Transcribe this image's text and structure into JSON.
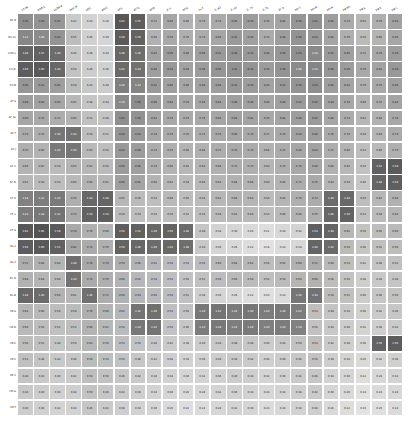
{
  "figure": {
    "type": "heatmap",
    "background": "#ffffff",
    "annotated": true,
    "colormap": "greys",
    "colormap_low": "#f2f2f2",
    "colormap_high": "#333333",
    "text_color_light": "#ffffff",
    "text_color_dark": "#262626"
  },
  "chart_data": {
    "type": "heatmap",
    "title": "",
    "xlabel": "",
    "ylabel": "",
    "grid": false,
    "legend": "none",
    "colorbar": false,
    "annotations": true,
    "colormap": "Greys",
    "vmin": 0.0,
    "vmax": 2.0,
    "x_tick_rotation": -30,
    "columns": [
      "FT-PB",
      "RQN-L",
      "LSTM-B",
      "PHP-JR",
      "SDJC",
      "BSVC",
      "AFS",
      "AFCL",
      "AFM",
      "JF-X",
      "AFLL",
      "FS-T",
      "IC-B2",
      "IC-SV",
      "IC-7S",
      "IC-TL",
      "ID-Q",
      "HD-1",
      "HD-M",
      "HD-N",
      "HB-NS",
      "HB-L",
      "HB-K",
      "HB-C"
    ],
    "rows": [
      "DF-B",
      "BH-VL",
      "CVD-L",
      "CV-JE",
      "CV-M",
      "AF-S",
      "AF-SL",
      "AF-T",
      "AF-J",
      "AF-C",
      "AF-N",
      "HF-K",
      "HF-L",
      "HF-S",
      "BL-1",
      "BL-2",
      "BL-Q",
      "BL-N",
      "HB-S",
      "HB-R",
      "HB-E",
      "HB-V",
      "HB-2",
      "HB-G",
      "HB-T"
    ],
    "values": [
      [
        1.05,
        1.0,
        0.95,
        0.42,
        0.33,
        0.28,
        1.62,
        1.55,
        0.72,
        0.8,
        0.66,
        0.7,
        0.74,
        0.86,
        0.9,
        0.78,
        0.82,
        0.96,
        1.02,
        0.88,
        0.74,
        0.62,
        0.7,
        0.84
      ],
      [
        1.12,
        1.08,
        0.98,
        0.55,
        0.36,
        0.3,
        1.58,
        1.5,
        0.68,
        0.76,
        0.7,
        0.74,
        0.8,
        0.92,
        0.86,
        0.74,
        0.88,
        1.0,
        0.94,
        0.82,
        0.7,
        0.58,
        0.66,
        0.8
      ],
      [
        1.48,
        1.52,
        1.4,
        0.46,
        0.38,
        0.34,
        1.46,
        1.38,
        0.84,
        0.9,
        0.8,
        0.86,
        0.92,
        0.98,
        0.94,
        0.88,
        0.96,
        1.04,
        1.1,
        0.92,
        0.86,
        0.72,
        0.78,
        0.9
      ],
      [
        1.56,
        1.6,
        1.44,
        0.5,
        0.4,
        0.36,
        1.42,
        1.34,
        0.88,
        0.94,
        0.84,
        0.9,
        0.96,
        1.02,
        0.98,
        0.9,
        1.0,
        1.08,
        1.14,
        0.96,
        0.9,
        0.76,
        0.82,
        0.94
      ],
      [
        0.96,
        0.92,
        0.88,
        0.58,
        0.44,
        0.4,
        1.2,
        1.14,
        0.92,
        0.86,
        0.8,
        0.84,
        0.88,
        0.94,
        0.9,
        0.84,
        0.92,
        0.98,
        1.04,
        0.88,
        0.82,
        0.7,
        0.76,
        0.86
      ],
      [
        0.88,
        0.84,
        0.8,
        0.62,
        0.48,
        0.44,
        1.1,
        1.06,
        0.86,
        0.82,
        0.78,
        0.8,
        0.84,
        0.88,
        0.86,
        0.8,
        0.86,
        0.92,
        0.96,
        0.84,
        0.78,
        0.66,
        0.72,
        0.82
      ],
      [
        0.8,
        0.76,
        0.72,
        0.66,
        0.52,
        0.48,
        1.04,
        1.0,
        0.82,
        0.78,
        0.74,
        0.76,
        0.8,
        0.84,
        0.82,
        0.76,
        0.82,
        0.88,
        0.92,
        0.8,
        0.74,
        0.62,
        0.68,
        0.78
      ],
      [
        0.74,
        0.7,
        1.3,
        1.34,
        0.56,
        0.52,
        0.98,
        0.94,
        0.78,
        0.74,
        0.7,
        0.72,
        0.76,
        0.8,
        0.78,
        0.72,
        0.78,
        0.84,
        0.88,
        0.76,
        0.7,
        0.58,
        0.64,
        0.74
      ],
      [
        0.7,
        0.66,
        1.26,
        1.3,
        0.6,
        0.56,
        0.94,
        0.9,
        0.74,
        0.7,
        0.66,
        0.68,
        0.72,
        0.76,
        0.74,
        0.68,
        0.74,
        0.8,
        0.84,
        0.72,
        0.66,
        0.54,
        0.6,
        0.7
      ],
      [
        0.66,
        0.62,
        0.58,
        0.64,
        0.62,
        0.58,
        0.9,
        0.86,
        0.7,
        0.66,
        0.62,
        0.64,
        0.68,
        0.72,
        0.7,
        0.64,
        0.7,
        0.76,
        0.8,
        0.68,
        0.62,
        0.5,
        1.52,
        1.58
      ],
      [
        0.62,
        0.58,
        0.54,
        0.6,
        0.66,
        0.62,
        0.86,
        0.82,
        0.66,
        0.62,
        0.58,
        0.6,
        0.64,
        0.68,
        0.66,
        0.6,
        0.66,
        0.72,
        0.76,
        0.64,
        0.58,
        0.46,
        1.48,
        1.54
      ],
      [
        1.18,
        1.22,
        1.26,
        0.7,
        1.44,
        1.48,
        0.62,
        0.58,
        0.54,
        0.6,
        0.56,
        0.58,
        0.62,
        0.66,
        0.64,
        0.58,
        0.64,
        0.7,
        0.74,
        1.4,
        1.44,
        0.56,
        0.62,
        0.68
      ],
      [
        1.24,
        1.28,
        1.32,
        0.74,
        1.5,
        1.54,
        0.58,
        0.54,
        0.5,
        0.56,
        0.52,
        0.54,
        0.58,
        0.62,
        0.6,
        0.54,
        0.6,
        0.66,
        0.7,
        1.46,
        1.5,
        0.52,
        0.58,
        0.64
      ],
      [
        1.62,
        1.66,
        1.58,
        0.78,
        0.7,
        0.66,
        1.56,
        1.52,
        1.46,
        1.5,
        1.42,
        0.48,
        0.34,
        0.3,
        0.26,
        0.22,
        0.28,
        0.32,
        1.54,
        1.48,
        0.62,
        0.5,
        0.56,
        0.6
      ],
      [
        1.56,
        1.6,
        1.52,
        0.82,
        0.74,
        0.7,
        1.5,
        1.46,
        1.4,
        1.44,
        1.38,
        0.44,
        0.3,
        0.26,
        0.22,
        0.18,
        0.24,
        0.28,
        1.48,
        1.42,
        0.58,
        0.46,
        0.52,
        0.56
      ],
      [
        0.72,
        0.68,
        0.64,
        1.38,
        0.78,
        0.74,
        0.7,
        0.66,
        0.62,
        0.58,
        0.54,
        0.56,
        0.6,
        0.64,
        0.62,
        0.56,
        0.62,
        0.68,
        0.72,
        0.6,
        0.54,
        0.42,
        0.48,
        0.52
      ],
      [
        0.68,
        0.64,
        0.6,
        1.34,
        0.74,
        0.7,
        0.66,
        0.62,
        0.58,
        0.54,
        0.5,
        0.52,
        0.56,
        0.6,
        0.58,
        0.52,
        0.58,
        0.64,
        0.68,
        0.56,
        0.5,
        0.38,
        0.44,
        0.48
      ],
      [
        1.44,
        1.4,
        0.66,
        0.62,
        1.36,
        0.72,
        0.68,
        0.64,
        0.6,
        0.56,
        0.52,
        0.38,
        0.3,
        0.26,
        0.22,
        0.2,
        0.24,
        1.3,
        1.34,
        0.58,
        0.52,
        0.4,
        0.46,
        0.5
      ],
      [
        0.64,
        0.6,
        0.56,
        0.58,
        0.7,
        0.66,
        0.62,
        1.32,
        1.36,
        0.54,
        0.5,
        1.28,
        1.32,
        1.26,
        1.3,
        1.24,
        1.28,
        1.22,
        0.54,
        0.48,
        0.44,
        0.36,
        0.42,
        0.46
      ],
      [
        0.6,
        0.56,
        0.52,
        0.54,
        0.66,
        0.62,
        0.58,
        1.28,
        1.32,
        0.5,
        0.46,
        1.24,
        1.28,
        1.22,
        1.26,
        1.2,
        1.24,
        1.18,
        0.5,
        0.44,
        0.4,
        0.32,
        0.38,
        0.42
      ],
      [
        0.56,
        0.52,
        0.48,
        0.5,
        0.62,
        0.58,
        0.54,
        0.5,
        0.46,
        0.42,
        0.38,
        0.4,
        0.44,
        0.48,
        0.46,
        0.4,
        0.44,
        0.5,
        0.54,
        0.42,
        0.38,
        0.3,
        1.5,
        1.56
      ],
      [
        0.52,
        0.48,
        0.44,
        0.46,
        0.58,
        0.54,
        0.5,
        0.46,
        0.42,
        0.38,
        0.34,
        0.36,
        0.4,
        0.44,
        0.42,
        0.36,
        0.4,
        0.46,
        0.5,
        0.38,
        0.34,
        0.26,
        0.32,
        0.36
      ],
      [
        0.48,
        0.44,
        0.4,
        0.42,
        0.54,
        0.5,
        0.46,
        0.42,
        0.38,
        0.34,
        0.3,
        0.32,
        0.36,
        0.4,
        0.38,
        0.32,
        0.36,
        0.42,
        0.46,
        0.34,
        0.3,
        0.22,
        0.28,
        0.32
      ],
      [
        0.44,
        0.4,
        0.36,
        0.38,
        0.5,
        0.46,
        0.42,
        0.38,
        0.34,
        0.3,
        0.26,
        0.28,
        0.32,
        0.36,
        0.34,
        0.28,
        0.32,
        0.38,
        0.42,
        0.3,
        0.26,
        0.18,
        0.24,
        0.28
      ],
      [
        0.4,
        0.36,
        0.32,
        0.34,
        0.46,
        0.42,
        0.38,
        0.34,
        0.3,
        0.26,
        0.22,
        0.24,
        0.28,
        0.32,
        0.3,
        0.24,
        0.28,
        0.34,
        0.38,
        0.26,
        0.22,
        0.16,
        0.2,
        0.24
      ]
    ]
  }
}
